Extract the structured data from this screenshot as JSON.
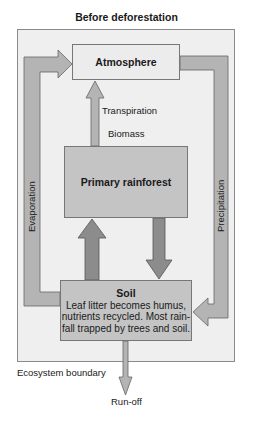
{
  "diagram": {
    "title": "Before deforestation",
    "nodes": {
      "atmosphere": "Atmosphere",
      "forest": "Primary rainforest",
      "soil": {
        "title": "Soil",
        "description": [
          "Leaf litter becomes humus,",
          "nutrients recycled. Most rain-",
          "fall trapped by trees and soil."
        ]
      }
    },
    "flows": {
      "evaporation": "Evaporation",
      "precipitation": "Precipitation",
      "transpiration": "Transpiration",
      "biomass": "Biomass",
      "runoff": "Run-off"
    },
    "boundary_label": "Ecosystem boundary",
    "colors": {
      "boundary_fill": "#efefef",
      "box_light": "#ececec",
      "box_dark": "#c4c4c4",
      "loop_arrow": "#b4b4b4",
      "nutrient_arrow": "#8c8c8c"
    }
  }
}
